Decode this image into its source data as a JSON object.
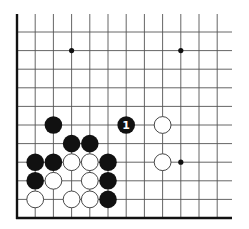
{
  "diagram": {
    "type": "go-board-fragment",
    "corner": "bottom-left",
    "columns": 12,
    "rows": 11,
    "grid": {
      "origin_x": 17,
      "origin_y": 32,
      "step_x": 18.2,
      "step_y": 18.6,
      "top_extent": 14,
      "right_extent": 232,
      "edge_left_x": 17,
      "edge_bottom_y": 218
    },
    "colors": {
      "background": "#ffffff",
      "grid_line": "#555555",
      "edge_line": "#111111",
      "black_stone": "#111111",
      "white_stone": "#ffffff",
      "white_stone_outline": "#333333",
      "star_point": "#111111",
      "label_on_black": "#ffffff"
    },
    "stone_radius": 8.8,
    "star_points": [
      {
        "col": 3,
        "row": 1
      },
      {
        "col": 9,
        "row": 1
      },
      {
        "col": 9,
        "row": 7
      }
    ],
    "stones": [
      {
        "color": "black",
        "col": 2,
        "row": 5,
        "label": ""
      },
      {
        "color": "black",
        "col": 6,
        "row": 5,
        "label": "1"
      },
      {
        "color": "white",
        "col": 8,
        "row": 5,
        "label": ""
      },
      {
        "color": "black",
        "col": 3,
        "row": 6,
        "label": ""
      },
      {
        "color": "black",
        "col": 4,
        "row": 6,
        "label": ""
      },
      {
        "color": "black",
        "col": 1,
        "row": 7,
        "label": ""
      },
      {
        "color": "black",
        "col": 2,
        "row": 7,
        "label": ""
      },
      {
        "color": "white",
        "col": 3,
        "row": 7,
        "label": ""
      },
      {
        "color": "white",
        "col": 4,
        "row": 7,
        "label": ""
      },
      {
        "color": "black",
        "col": 5,
        "row": 7,
        "label": ""
      },
      {
        "color": "white",
        "col": 8,
        "row": 7,
        "label": ""
      },
      {
        "color": "black",
        "col": 1,
        "row": 8,
        "label": ""
      },
      {
        "color": "white",
        "col": 2,
        "row": 8,
        "label": ""
      },
      {
        "color": "white",
        "col": 4,
        "row": 8,
        "label": ""
      },
      {
        "color": "black",
        "col": 5,
        "row": 8,
        "label": ""
      },
      {
        "color": "white",
        "col": 1,
        "row": 9,
        "label": ""
      },
      {
        "color": "white",
        "col": 3,
        "row": 9,
        "label": ""
      },
      {
        "color": "white",
        "col": 4,
        "row": 9,
        "label": ""
      },
      {
        "color": "black",
        "col": 5,
        "row": 9,
        "label": ""
      }
    ],
    "move_label": "1"
  }
}
